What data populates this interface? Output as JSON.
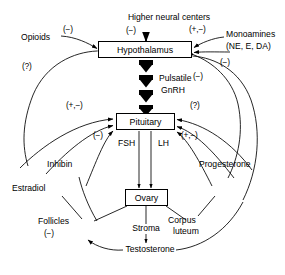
{
  "diagram": {
    "boxes": [
      {
        "id": "hypothalamus",
        "label": "Hypothalamus"
      },
      {
        "id": "pituitary",
        "label": "Pituitary"
      },
      {
        "id": "ovary",
        "label": "Ovary"
      }
    ],
    "nodes": [
      {
        "id": "higher-neural-centers",
        "label": "Higher neural centers"
      },
      {
        "id": "opioids",
        "label": "Opioids"
      },
      {
        "id": "monoamines",
        "label": "Monoamines"
      },
      {
        "id": "monoamines-detail",
        "label": "(NE, E, DA)"
      },
      {
        "id": "pulsatile",
        "label": "Pulsatile"
      },
      {
        "id": "gnrh",
        "label": "GnRH"
      },
      {
        "id": "fsh",
        "label": "FSH"
      },
      {
        "id": "lh",
        "label": "LH"
      },
      {
        "id": "inhibin",
        "label": "Inhibin"
      },
      {
        "id": "estradiol",
        "label": "Estradiol"
      },
      {
        "id": "follicles",
        "label": "Follicles"
      },
      {
        "id": "progesterone",
        "label": "Progesterone"
      },
      {
        "id": "corpus",
        "label": "Corpus"
      },
      {
        "id": "luteum",
        "label": "luteum"
      },
      {
        "id": "stroma",
        "label": "Stroma"
      },
      {
        "id": "testosterone",
        "label": "Testosterone"
      }
    ],
    "signs": [
      {
        "id": "sign-higher-neural",
        "label": "(−)"
      },
      {
        "id": "sign-opioids",
        "label": "(−)"
      },
      {
        "id": "sign-opioids-question",
        "label": "(?)"
      },
      {
        "id": "sign-monoamines-plusminus",
        "label": "(+,−)"
      },
      {
        "id": "sign-monoamines-minus",
        "label": "(−)"
      },
      {
        "id": "sign-gnrh-minus",
        "label": "(−)"
      },
      {
        "id": "sign-pituitary-left-plusminus",
        "label": "(+,−)"
      },
      {
        "id": "sign-pituitary-left-minus",
        "label": "(−)"
      },
      {
        "id": "sign-pituitary-right-question",
        "label": "(?)"
      },
      {
        "id": "sign-pituitary-right-plusminus",
        "label": "(+,−)"
      },
      {
        "id": "sign-follicles-minus",
        "label": "(−)"
      }
    ],
    "colors": {
      "stroke": "#000000",
      "background": "#ffffff"
    }
  }
}
